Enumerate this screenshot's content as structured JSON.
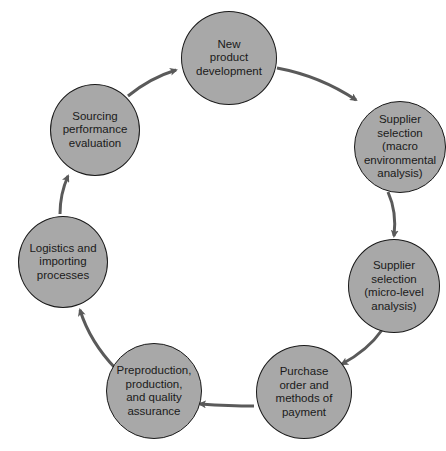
{
  "diagram": {
    "type": "cycle",
    "direction": "clockwise",
    "colors": {
      "node_fill": "#a8a8a8",
      "node_border": "#1a1a1a",
      "arrow": "#5a5a5a",
      "background": "#ffffff"
    },
    "nodes": [
      {
        "id": "new-product-development",
        "label": "New\nproduct\ndevelopment"
      },
      {
        "id": "supplier-selection-macro",
        "label": "Supplier\nselection\n(macro\nenvironmental\nanalysis)"
      },
      {
        "id": "supplier-selection-micro",
        "label": "Supplier\nselection\n(micro-level\nanalysis)"
      },
      {
        "id": "purchase-order",
        "label": "Purchase\norder and\nmethods of\npayment"
      },
      {
        "id": "preproduction",
        "label": "Preproduction,\nproduction,\nand quality\nassurance"
      },
      {
        "id": "logistics",
        "label": "Logistics and\nimporting\nprocesses"
      },
      {
        "id": "sourcing-evaluation",
        "label": "Sourcing\nperformance\nevaluation"
      }
    ],
    "edges": [
      {
        "from": "new-product-development",
        "to": "supplier-selection-macro"
      },
      {
        "from": "supplier-selection-macro",
        "to": "supplier-selection-micro"
      },
      {
        "from": "supplier-selection-micro",
        "to": "purchase-order"
      },
      {
        "from": "purchase-order",
        "to": "preproduction"
      },
      {
        "from": "preproduction",
        "to": "logistics"
      },
      {
        "from": "logistics",
        "to": "sourcing-evaluation"
      },
      {
        "from": "sourcing-evaluation",
        "to": "new-product-development"
      }
    ]
  }
}
